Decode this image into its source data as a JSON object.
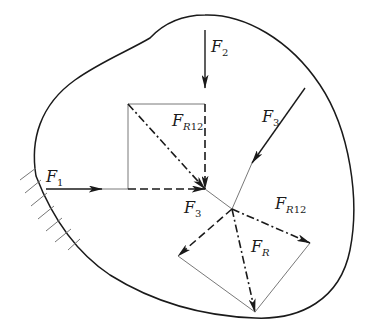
{
  "diagram": {
    "type": "force-composition",
    "colors": {
      "stroke": "#1a1a1a",
      "thin_stroke": "#555555",
      "hatch": "#777777",
      "background": "#ffffff"
    },
    "labels": {
      "F1": {
        "main": "F",
        "sub": "1"
      },
      "F2": {
        "main": "F",
        "sub": "2"
      },
      "F3_top": {
        "main": "F",
        "sub": "3"
      },
      "FR12_top": {
        "main": "F",
        "sub_italic": "R",
        "sub": "12"
      },
      "F3_bottom": {
        "main": "F",
        "sub": "3"
      },
      "FR12_bottom": {
        "main": "F",
        "sub_italic": "R",
        "sub": "12"
      },
      "FR": {
        "main": "F",
        "sub_italic": "R"
      }
    },
    "points": {
      "A_concurrency_upper": [
        205,
        189
      ],
      "O_concurrency_lower": [
        232,
        209
      ],
      "F3_tip": [
        178,
        256
      ],
      "FR12_tip": [
        310,
        243
      ],
      "FR_tip": [
        255,
        312
      ],
      "rect_topleft": [
        128,
        104
      ],
      "rect_bottomleft": [
        128,
        189
      ]
    },
    "forces": [
      {
        "name": "F1",
        "from": [
          46,
          189
        ],
        "to": [
          102,
          189
        ],
        "style": "solid"
      },
      {
        "name": "F2",
        "from": [
          205,
          30
        ],
        "to": [
          205,
          88
        ],
        "style": "solid"
      },
      {
        "name": "F3",
        "from": [
          305,
          88
        ],
        "to": [
          252,
          163
        ],
        "style": "solid"
      },
      {
        "name": "F1_shifted",
        "from": [
          128,
          189
        ],
        "to": [
          205,
          189
        ],
        "style": "dashed"
      },
      {
        "name": "F2_shifted",
        "from": [
          205,
          104
        ],
        "to": [
          205,
          189
        ],
        "style": "dashed"
      },
      {
        "name": "FR12",
        "from": [
          128,
          104
        ],
        "to": [
          205,
          189
        ],
        "style": "dash-dot"
      },
      {
        "name": "F3_shifted",
        "from": [
          232,
          209
        ],
        "to": [
          178,
          256
        ],
        "style": "dashed"
      },
      {
        "name": "FR12_shifted",
        "from": [
          232,
          209
        ],
        "to": [
          310,
          243
        ],
        "style": "dash-dot"
      },
      {
        "name": "FR",
        "from": [
          232,
          209
        ],
        "to": [
          255,
          312
        ],
        "style": "dash-dot"
      }
    ]
  }
}
